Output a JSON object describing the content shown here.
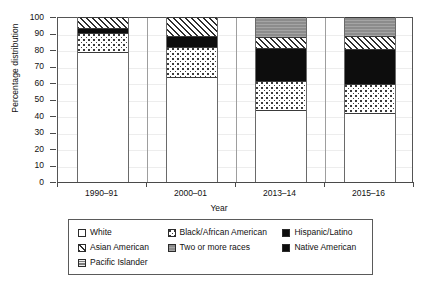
{
  "chart_data": {
    "type": "bar",
    "stacked": true,
    "title": "",
    "xlabel": "Year",
    "ylabel": "Percentage distribution",
    "categories": [
      "1990–91",
      "2000–01",
      "2013–14",
      "2015–16"
    ],
    "ylim": [
      0,
      100
    ],
    "ytick_labels": [
      "0",
      "10",
      "20",
      "30",
      "40",
      "50",
      "60",
      "70",
      "80",
      "90",
      "100"
    ],
    "ytick_values": [
      0,
      10,
      20,
      30,
      40,
      50,
      60,
      70,
      80,
      90,
      100
    ],
    "grid": true,
    "legend_position": "bottom",
    "series": [
      {
        "name": "White",
        "pattern": "solid-white",
        "values": [
          78.5,
          63.5,
          43.5,
          42.0
        ]
      },
      {
        "name": "Black/African American",
        "pattern": "light-dotted",
        "values": [
          12.0,
          18.5,
          17.5,
          17.5
        ]
      },
      {
        "name": "Hispanic/Latino",
        "pattern": "solid-black",
        "values": [
          0.0,
          0.0,
          20.0,
          21.0
        ]
      },
      {
        "name": "Asian American",
        "pattern": "diagonal-hatch",
        "values": [
          6.5,
          11.5,
          7.0,
          8.0
        ]
      },
      {
        "name": "Two or more races",
        "pattern": "solid-gray",
        "values": [
          0.0,
          0.0,
          12.0,
          11.5
        ]
      },
      {
        "name": "Native American",
        "pattern": "solid-black",
        "values": [
          3.0,
          6.5,
          0.0,
          0.0
        ]
      },
      {
        "name": "Pacific Islander",
        "pattern": "gray-lines",
        "values": [
          0.0,
          0.0,
          0.0,
          0.0
        ]
      }
    ],
    "stack_order_bottom_to_top": [
      "White",
      "Black/African American",
      "Hispanic/Latino",
      "Native American",
      "Asian American",
      "Two or more races",
      "Pacific Islander"
    ]
  },
  "legend": {
    "rows": [
      [
        {
          "label": "White",
          "key": "white"
        },
        {
          "label": "Black/African American",
          "key": "black-aa"
        },
        {
          "label": "Hispanic/Latino",
          "key": "hispanic"
        }
      ],
      [
        {
          "label": "Asian American",
          "key": "asian"
        },
        {
          "label": "Two or more races",
          "key": "two"
        },
        {
          "label": "Native American",
          "key": "native"
        }
      ],
      [
        {
          "label": "Pacific Islander",
          "key": "pacific"
        }
      ]
    ]
  },
  "colors": {
    "axis": "#4a4a4a",
    "grid": "#ededed",
    "ink": "#111111",
    "solid_black": "#0d0d0d",
    "solid_gray": "#8c8c8c",
    "pacific_gray": "#9a9a9a",
    "background": "#ffffff"
  }
}
